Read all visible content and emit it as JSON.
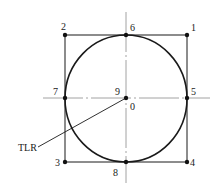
{
  "diagram": {
    "type": "geometric-construction",
    "colors": {
      "line": "#1a1a1a",
      "centerline": "#8a8a8a",
      "background": "#ffffff"
    },
    "points": [
      {
        "id": "1",
        "label": "1",
        "x": 187,
        "y": 35,
        "position": "top-right corner"
      },
      {
        "id": "2",
        "label": "2",
        "x": 65,
        "y": 35,
        "position": "top-left corner"
      },
      {
        "id": "3",
        "label": "3",
        "x": 65,
        "y": 162,
        "position": "bottom-left corner"
      },
      {
        "id": "4",
        "label": "4",
        "x": 187,
        "y": 162,
        "position": "bottom-right corner"
      },
      {
        "id": "5",
        "label": "5",
        "x": 187,
        "y": 98,
        "position": "right tangent point"
      },
      {
        "id": "6",
        "label": "6",
        "x": 126,
        "y": 35,
        "position": "top tangent point"
      },
      {
        "id": "7",
        "label": "7",
        "x": 65,
        "y": 98,
        "position": "left tangent point"
      },
      {
        "id": "8",
        "label": "8",
        "x": 126,
        "y": 162,
        "position": "bottom tangent point"
      },
      {
        "id": "9",
        "label": "9",
        "x": 126,
        "y": 98,
        "position": "center"
      }
    ],
    "labels": {
      "p1": "1",
      "p2": "2",
      "p3": "3",
      "p4": "4",
      "p5": "5",
      "p6": "6",
      "p7": "7",
      "p8": "8",
      "p9": "9",
      "origin": "0",
      "leader": "TLR"
    },
    "circle": {
      "cx": 126,
      "cy": 98,
      "r": 61
    },
    "square": {
      "x1": 65,
      "y1": 35,
      "x2": 187,
      "y2": 162
    },
    "centerlines": {
      "vertical": {
        "x": 126,
        "y1": 12,
        "y2": 183
      },
      "horizontal": {
        "y": 98,
        "x1": 43,
        "x2": 210
      }
    },
    "leader_line": {
      "from": [
        38,
        147
      ],
      "to": [
        126,
        98
      ],
      "text": "TLR"
    }
  }
}
